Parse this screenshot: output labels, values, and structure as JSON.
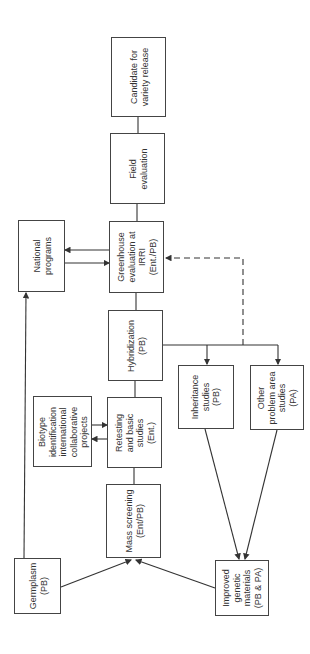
{
  "diagram": {
    "orientation": "rotated -90deg",
    "line_color": "#333333",
    "nodes": [
      {
        "id": "candidate",
        "label": "Candidate for\nvariety release",
        "box": [
          111,
          37,
          55,
          80
        ]
      },
      {
        "id": "field",
        "label": "Field\nevaluation",
        "box": [
          110,
          133,
          55,
          71
        ]
      },
      {
        "id": "greenhouse",
        "label": "Greenhouse\nevaluation at\nIRRI\n(Ent./PB)",
        "box": [
          109,
          221,
          55,
          72
        ]
      },
      {
        "id": "national",
        "label": "National\nprograms",
        "box": [
          18,
          220,
          47,
          72
        ]
      },
      {
        "id": "hybridization",
        "label": "Hybridization\n(PB)",
        "box": [
          108,
          310,
          55,
          71
        ]
      },
      {
        "id": "retesting",
        "label": "Retesting\nand basic\nstudies\n(Ent.)",
        "box": [
          107,
          397,
          55,
          71
        ]
      },
      {
        "id": "biotype",
        "label": "Biotype\nidentification\ninternational\ncollaborative\nprojects",
        "box": [
          33,
          396,
          59,
          71
        ]
      },
      {
        "id": "mass",
        "label": "Mass screening\n(Ent/PB)",
        "box": [
          106,
          484,
          55,
          74
        ]
      },
      {
        "id": "germplasm",
        "label": "Germplasm\n(PB)",
        "box": [
          14,
          558,
          47,
          56
        ]
      },
      {
        "id": "inheritance",
        "label": "Inheritance\nstudies\n(PB)",
        "box": [
          178,
          365,
          56,
          64
        ]
      },
      {
        "id": "otherproblem",
        "label": "Other\nproblem area\nstudies\n(PA)",
        "box": [
          250,
          365,
          54,
          65
        ]
      },
      {
        "id": "improved",
        "label": "Improved\ngenetic\nmaterials\n(PB & PA)",
        "box": [
          215,
          560,
          54,
          56
        ]
      }
    ],
    "edges": [
      {
        "from": "field",
        "to": "candidate",
        "style": "solid"
      },
      {
        "from": "greenhouse",
        "to": "field",
        "style": "solid"
      },
      {
        "from": "greenhouse",
        "to": "national",
        "style": "solid",
        "arrow": "both"
      },
      {
        "from": "hybridization",
        "to": "greenhouse",
        "style": "solid"
      },
      {
        "from": "retesting",
        "to": "hybridization",
        "style": "solid"
      },
      {
        "from": "retesting",
        "to": "biotype",
        "style": "solid",
        "arrow": "both"
      },
      {
        "from": "mass",
        "to": "retesting",
        "style": "solid"
      },
      {
        "from": "germplasm",
        "to": "national",
        "style": "solid",
        "arrow": "end"
      },
      {
        "from": "germplasm",
        "to": "mass",
        "style": "solid",
        "arrow": "end"
      },
      {
        "from": "improved",
        "to": "mass",
        "style": "solid",
        "arrow": "end"
      },
      {
        "from": "hybridization",
        "to": "inheritance",
        "style": "solid",
        "arrow": "end"
      },
      {
        "from": "hybridization",
        "to": "otherproblem",
        "style": "solid",
        "arrow": "end"
      },
      {
        "from": "inheritance",
        "to": "improved",
        "style": "solid",
        "arrow": "end"
      },
      {
        "from": "otherproblem",
        "to": "improved",
        "style": "solid",
        "arrow": "end"
      },
      {
        "from": "hybridization",
        "to": "greenhouse",
        "style": "dashed",
        "arrow": "end",
        "note": "feedback loop"
      }
    ]
  }
}
